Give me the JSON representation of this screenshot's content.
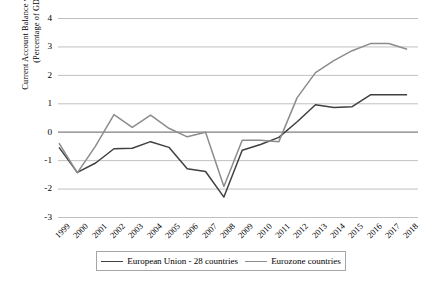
{
  "chart_data": {
    "type": "line",
    "title": "",
    "xlabel": "",
    "ylabel": "Current Account Balance with ROW (Percentage of GDP)",
    "ylabel_line1": "Current Account Balance with ROW",
    "ylabel_line2": "(Percentage of GDP)",
    "categories": [
      "1999",
      "2000",
      "2001",
      "2002",
      "2003",
      "2004",
      "2005",
      "2006",
      "2007",
      "2008",
      "2009",
      "2010",
      "2011",
      "2012",
      "2013",
      "2014",
      "2015",
      "2016",
      "2017",
      "2018"
    ],
    "ylim": [
      -3,
      4
    ],
    "yticks": [
      "4",
      "3",
      "2",
      "1",
      "0",
      "-1",
      "-2",
      "-3"
    ],
    "ytick_values": [
      4,
      3,
      2,
      1,
      0,
      -1,
      -2,
      -3
    ],
    "grid": true,
    "grid_axis": "y",
    "legend_position": "bottom",
    "series": [
      {
        "name": "European Union - 28 countries",
        "color": "#404040",
        "values": [
          -0.55,
          -1.43,
          -1.1,
          -0.6,
          -0.58,
          -0.35,
          -0.55,
          -1.3,
          -1.4,
          -2.3,
          -0.65,
          -0.45,
          -0.2,
          0.35,
          0.95,
          0.85,
          0.88,
          1.3,
          1.3,
          1.3
        ]
      },
      {
        "name": "Eurozone countries",
        "color": "#8c8c8c",
        "values": [
          -0.4,
          -1.45,
          -0.5,
          0.6,
          0.15,
          0.58,
          0.12,
          -0.18,
          -0.02,
          -1.93,
          -0.3,
          -0.3,
          -0.35,
          1.2,
          2.08,
          2.5,
          2.85,
          3.1,
          3.1,
          2.9
        ]
      }
    ]
  },
  "legend": {
    "items": [
      {
        "label": "European Union - 28 countries",
        "color": "#404040"
      },
      {
        "label": "Eurozone countries",
        "color": "#8c8c8c"
      }
    ]
  }
}
